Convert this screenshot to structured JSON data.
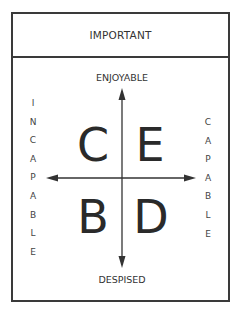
{
  "header": {
    "title": "IMPORTANT"
  },
  "axes": {
    "top_label": "ENJOYABLE",
    "bottom_label": "DESPISED",
    "left_label_letters": [
      "I",
      "N",
      "C",
      "A",
      "P",
      "A",
      "B",
      "L",
      "E"
    ],
    "right_label_letters": [
      "C",
      "A",
      "P",
      "A",
      "B",
      "L",
      "E"
    ]
  },
  "quadrants": {
    "top_left": "C",
    "top_right": "E",
    "bottom_left": "B",
    "bottom_right": "D"
  },
  "colors": {
    "stroke": "#3a3a3a",
    "text": "#2a2a2a",
    "background": "#ffffff"
  }
}
